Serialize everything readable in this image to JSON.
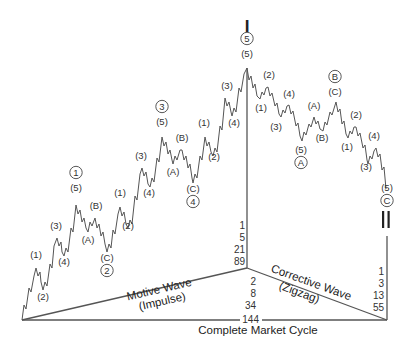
{
  "degree_labels": {
    "top": "I",
    "bottom": "II"
  },
  "motive": {
    "caption_line1": "Motive Wave",
    "caption_line2": "(Impulse)",
    "waves": [
      {
        "sub": "(1)",
        "x": 36,
        "y": 258
      },
      {
        "sub": "(2)",
        "x": 43,
        "y": 300
      },
      {
        "sub": "(3)",
        "x": 56,
        "y": 229
      },
      {
        "sub": "(4)",
        "x": 64,
        "y": 265
      },
      {
        "sub": "(5)",
        "circle": "1",
        "x": 76,
        "y": 191
      },
      {
        "sub": "(A)",
        "x": 88,
        "y": 243
      },
      {
        "sub": "(B)",
        "x": 96,
        "y": 209
      },
      {
        "sub": "(C)",
        "circle": "2",
        "x": 107,
        "y": 261
      },
      {
        "sub": "(1)",
        "x": 120,
        "y": 196
      },
      {
        "sub": "(2)",
        "x": 128,
        "y": 229
      },
      {
        "sub": "(3)",
        "x": 141,
        "y": 159
      },
      {
        "sub": "(4)",
        "x": 149,
        "y": 196
      },
      {
        "sub": "(5)",
        "circle": "3",
        "x": 162,
        "y": 125
      },
      {
        "sub": "(A)",
        "x": 173,
        "y": 175
      },
      {
        "sub": "(B)",
        "x": 182,
        "y": 141
      },
      {
        "sub": "(C)",
        "circle": "4",
        "x": 193,
        "y": 192
      },
      {
        "sub": "(1)",
        "x": 204,
        "y": 126
      },
      {
        "sub": "(2)",
        "x": 214,
        "y": 160
      },
      {
        "sub": "(3)",
        "x": 227,
        "y": 89
      },
      {
        "sub": "(4)",
        "x": 234,
        "y": 126
      },
      {
        "sub": "(5)",
        "circle": "5",
        "x": 247,
        "y": 57
      }
    ]
  },
  "corrective": {
    "caption_line1": "Corrective Wave",
    "caption_line2": "(Zigzag)",
    "waves": [
      {
        "sub": "(2)",
        "x": 269,
        "y": 78
      },
      {
        "sub": "(1)",
        "x": 261,
        "y": 111
      },
      {
        "sub": "(4)",
        "x": 289,
        "y": 97
      },
      {
        "sub": "(3)",
        "x": 276,
        "y": 130
      },
      {
        "sub": "(5)",
        "circle": "A",
        "x": 301,
        "y": 153
      },
      {
        "sub": "(A)",
        "x": 314,
        "y": 109
      },
      {
        "sub": "(B)",
        "x": 322,
        "y": 141
      },
      {
        "sub": "(C)",
        "circle": "B",
        "x": 335,
        "y": 95
      },
      {
        "sub": "(2)",
        "x": 356,
        "y": 118
      },
      {
        "sub": "(1)",
        "x": 347,
        "y": 150
      },
      {
        "sub": "(4)",
        "x": 374,
        "y": 139
      },
      {
        "sub": "(3)",
        "x": 366,
        "y": 170
      },
      {
        "sub": "(5)",
        "circle": "C",
        "x": 387,
        "y": 191
      }
    ]
  },
  "fibonacci": {
    "motive_counts": [
      "1",
      "5",
      "21",
      "89"
    ],
    "corrective_counts": [
      "2",
      "8",
      "34",
      "144"
    ],
    "zigzag_counts": [
      "1",
      "3",
      "13",
      "55"
    ]
  },
  "cycle_caption": "Complete Market Cycle"
}
